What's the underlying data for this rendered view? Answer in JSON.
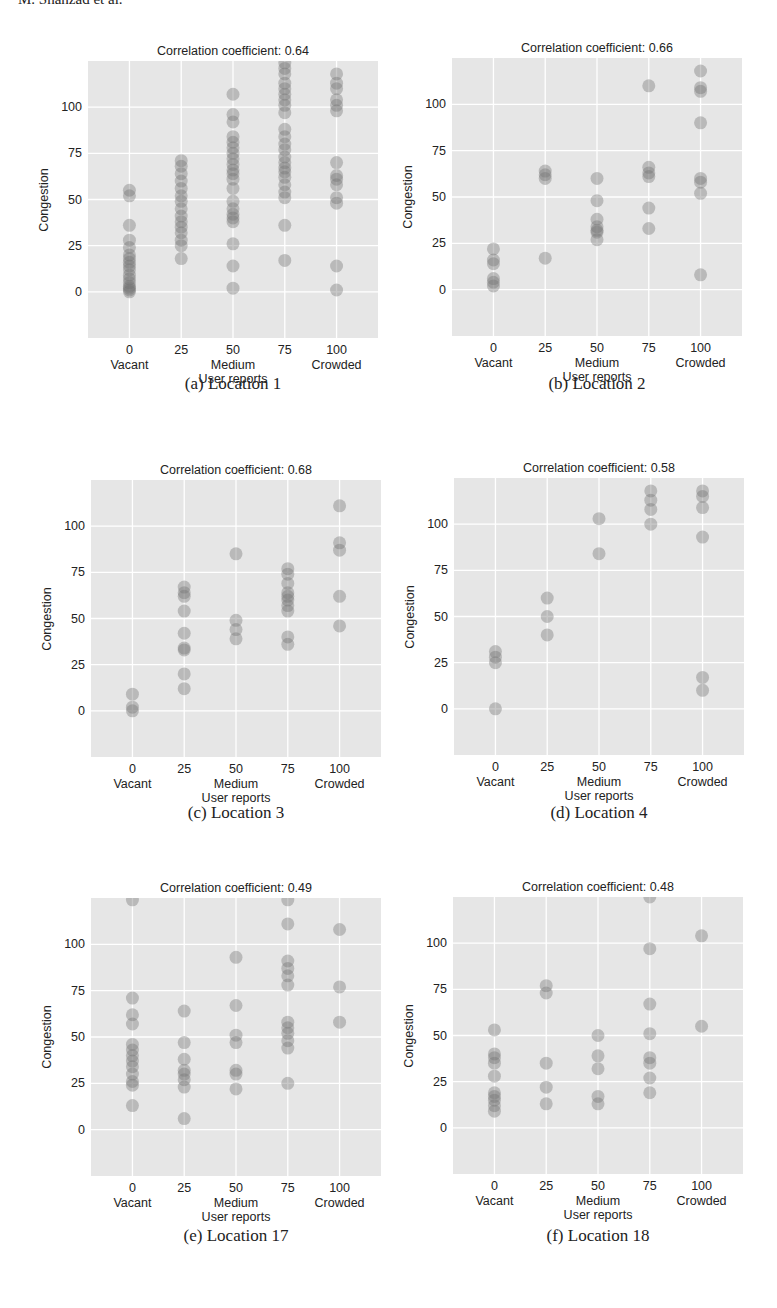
{
  "header_fragment": "M. Shahzad et al.",
  "common": {
    "xlabel": "User reports",
    "ylabel": "Congestion",
    "x_ticks": [
      {
        "value": 0,
        "label": "0",
        "sublabel": "Vacant"
      },
      {
        "value": 25,
        "label": "25",
        "sublabel": ""
      },
      {
        "value": 50,
        "label": "50",
        "sublabel": "Medium"
      },
      {
        "value": 75,
        "label": "75",
        "sublabel": ""
      },
      {
        "value": 100,
        "label": "100",
        "sublabel": "Crowded"
      }
    ],
    "y_ticks": [
      0,
      25,
      50,
      75,
      100
    ],
    "xlim": [
      -20,
      120
    ],
    "ylim": [
      -25,
      125
    ],
    "colors": {
      "plot_background": "#e6e6e6",
      "grid": "#ffffff",
      "marker": "#707070",
      "text": "#222222"
    }
  },
  "panels": [
    {
      "id": "a",
      "caption": "(a) Location 1",
      "title": "Correlation coefficient: 0.64"
    },
    {
      "id": "b",
      "caption": "(b) Location 2",
      "title": "Correlation coefficient: 0.66"
    },
    {
      "id": "c",
      "caption": "(c) Location 3",
      "title": "Correlation coefficient: 0.68"
    },
    {
      "id": "d",
      "caption": "(d) Location 4",
      "title": "Correlation coefficient: 0.58"
    },
    {
      "id": "e",
      "caption": "(e) Location 17",
      "title": "Correlation coefficient: 0.49"
    },
    {
      "id": "f",
      "caption": "(f) Location 18",
      "title": "Correlation coefficient: 0.48"
    }
  ],
  "chart_data": [
    {
      "type": "scatter",
      "title": "Correlation coefficient: 0.64",
      "caption": "(a) Location 1",
      "xlabel": "User reports",
      "ylabel": "Congestion",
      "xlim": [
        -20,
        120
      ],
      "ylim": [
        -25,
        125
      ],
      "grid": true,
      "x_tick_labels": [
        "0\nVacant",
        "25",
        "50\nMedium",
        "75",
        "100\nCrowded"
      ],
      "y_tick_labels": [
        "0",
        "25",
        "50",
        "75",
        "100"
      ],
      "correlation": 0.64,
      "points": {
        "0": [
          0,
          1,
          2,
          3,
          5,
          7,
          9,
          12,
          14,
          16,
          18,
          20,
          24,
          28,
          36,
          52,
          55
        ],
        "25": [
          18,
          25,
          28,
          32,
          35,
          38,
          41,
          45,
          49,
          52,
          56,
          60,
          64,
          68,
          71
        ],
        "50": [
          2,
          14,
          26,
          38,
          40,
          42,
          45,
          49,
          56,
          61,
          64,
          66,
          69,
          72,
          75,
          78,
          81,
          84,
          92,
          96,
          107
        ],
        "75": [
          17,
          36,
          51,
          54,
          58,
          62,
          65,
          67,
          70,
          73,
          77,
          80,
          84,
          88,
          97,
          101,
          104,
          107,
          110,
          113,
          118,
          121,
          124
        ],
        "100": [
          1,
          14,
          48,
          51,
          58,
          61,
          63,
          70,
          98,
          101,
          104,
          110,
          113,
          118
        ]
      }
    },
    {
      "type": "scatter",
      "title": "Correlation coefficient: 0.66",
      "caption": "(b) Location 2",
      "xlabel": "User reports",
      "ylabel": "Congestion",
      "xlim": [
        -20,
        120
      ],
      "ylim": [
        -25,
        125
      ],
      "grid": true,
      "correlation": 0.66,
      "points": {
        "0": [
          2,
          4,
          6,
          14,
          16,
          22
        ],
        "25": [
          17,
          60,
          62,
          64
        ],
        "50": [
          27,
          31,
          32,
          34,
          38,
          48,
          60
        ],
        "75": [
          33,
          44,
          61,
          63,
          66,
          110
        ],
        "100": [
          8,
          52,
          58,
          60,
          90,
          107,
          109,
          118
        ]
      }
    },
    {
      "type": "scatter",
      "title": "Correlation coefficient: 0.68",
      "caption": "(c) Location 3",
      "xlabel": "User reports",
      "ylabel": "Congestion",
      "xlim": [
        -20,
        120
      ],
      "ylim": [
        -25,
        125
      ],
      "grid": true,
      "correlation": 0.68,
      "points": {
        "0": [
          0,
          2,
          9
        ],
        "25": [
          12,
          20,
          33,
          34,
          42,
          54,
          62,
          64,
          67
        ],
        "50": [
          39,
          44,
          49,
          85
        ],
        "75": [
          36,
          40,
          54,
          57,
          60,
          62,
          64,
          69,
          74,
          77
        ],
        "100": [
          46,
          62,
          87,
          91,
          111
        ]
      }
    },
    {
      "type": "scatter",
      "title": "Correlation coefficient: 0.58",
      "caption": "(d) Location 4",
      "xlabel": "User reports",
      "ylabel": "Congestion",
      "xlim": [
        -20,
        120
      ],
      "ylim": [
        -25,
        125
      ],
      "grid": true,
      "correlation": 0.58,
      "points": {
        "0": [
          0,
          25,
          28,
          31
        ],
        "25": [
          40,
          50,
          60
        ],
        "50": [
          84,
          103
        ],
        "75": [
          100,
          108,
          113,
          118
        ],
        "100": [
          10,
          17,
          93,
          109,
          115,
          118
        ]
      }
    },
    {
      "type": "scatter",
      "title": "Correlation coefficient: 0.49",
      "caption": "(e) Location 17",
      "xlabel": "User reports",
      "ylabel": "Congestion",
      "xlim": [
        -20,
        120
      ],
      "ylim": [
        -25,
        125
      ],
      "grid": true,
      "correlation": 0.49,
      "points": {
        "0": [
          13,
          24,
          26,
          30,
          34,
          37,
          40,
          43,
          46,
          57,
          62,
          71,
          124
        ],
        "25": [
          6,
          23,
          27,
          30,
          32,
          38,
          47,
          64
        ],
        "50": [
          22,
          30,
          32,
          47,
          51,
          67,
          93
        ],
        "75": [
          25,
          44,
          48,
          52,
          55,
          58,
          78,
          83,
          87,
          91,
          111,
          124
        ],
        "100": [
          58,
          77,
          108
        ]
      }
    },
    {
      "type": "scatter",
      "title": "Correlation coefficient: 0.48",
      "caption": "(f) Location 18",
      "xlabel": "User reports",
      "ylabel": "Congestion",
      "xlim": [
        -20,
        120
      ],
      "ylim": [
        -25,
        125
      ],
      "grid": true,
      "correlation": 0.48,
      "points": {
        "0": [
          9,
          12,
          15,
          17,
          19,
          28,
          35,
          38,
          40,
          53
        ],
        "25": [
          13,
          22,
          35,
          73,
          77
        ],
        "50": [
          13,
          17,
          32,
          39,
          50
        ],
        "75": [
          19,
          27,
          35,
          38,
          51,
          67,
          97,
          125
        ],
        "100": [
          55,
          104
        ]
      }
    }
  ]
}
